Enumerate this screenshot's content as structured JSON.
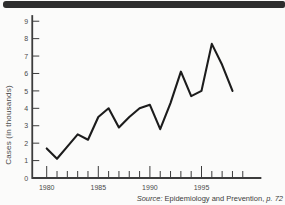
{
  "top_bar": {
    "color": "#2e2e2e"
  },
  "chart_data": {
    "type": "line",
    "title": "",
    "ylabel": "Cases (in thousands)",
    "xlabel": "",
    "x": [
      1980,
      1981,
      1982,
      1983,
      1984,
      1985,
      1986,
      1987,
      1988,
      1989,
      1990,
      1991,
      1992,
      1993,
      1994,
      1995,
      1996,
      1997,
      1998
    ],
    "values": [
      1.7,
      1.1,
      1.8,
      2.5,
      2.2,
      3.5,
      4.0,
      2.9,
      3.5,
      4.0,
      4.2,
      2.8,
      4.3,
      6.1,
      4.7,
      5.0,
      7.7,
      6.5,
      5.0
    ],
    "series_name": "Cases (in thousands)",
    "y_ticks": [
      0,
      1,
      2,
      3,
      4,
      5,
      6,
      7,
      8,
      9
    ],
    "ylim": [
      0,
      9.35
    ],
    "xlim": [
      1978.6,
      2000.8
    ],
    "x_minor_tick_start": 1980,
    "x_minor_tick_end": 1999,
    "x_label_years": [
      1980,
      1985,
      1990,
      1995
    ],
    "grid": false,
    "legend": "none",
    "line_color": "#1c1c1c",
    "axis_color": "#3c3c3c",
    "label_color": "#4a4a4a"
  },
  "source": {
    "label": "Source:",
    "body": " Epidemiology and Prevention, ",
    "page": "p. 72"
  }
}
